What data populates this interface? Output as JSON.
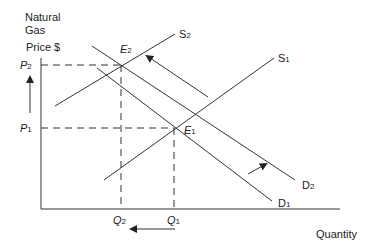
{
  "diagram": {
    "title_line1": "Natural",
    "title_line2": "Gas",
    "y_axis_label": "Price $",
    "x_axis_label": "Quantity",
    "price_labels": [
      {
        "base": "P",
        "sub": "2"
      },
      {
        "base": "P",
        "sub": "1"
      }
    ],
    "quantity_labels": [
      {
        "base": "Q",
        "sub": "2"
      },
      {
        "base": "Q",
        "sub": "1"
      }
    ],
    "equilibria": [
      {
        "base": "E",
        "sub": "2"
      },
      {
        "base": "E",
        "sub": "1"
      }
    ],
    "curves": {
      "s2": {
        "base": "S",
        "sub": "2"
      },
      "s1": {
        "base": "S",
        "sub": "1"
      },
      "d2": {
        "base": "D",
        "sub": "2"
      },
      "d1": {
        "base": "D",
        "sub": "1"
      }
    },
    "colors": {
      "line": "#333333",
      "background": "#ffffff"
    }
  }
}
